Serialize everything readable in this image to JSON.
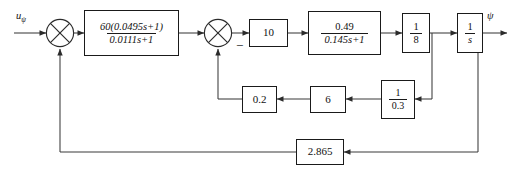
{
  "diagram": {
    "input_label": "u",
    "input_subscript": "ψ",
    "output_label": "ψ",
    "minus_sign": "−",
    "line_color": "#3a3a3a",
    "block_border_color": "#1a1a1a",
    "background": "#ffffff"
  },
  "blocks": [
    {
      "id": "controller",
      "name": "lead-lag-controller",
      "kind": "transfer-function",
      "numerator": "60(0.0495s+1)",
      "denominator": "0.0111s+1"
    },
    {
      "id": "gain10",
      "name": "gain-10",
      "kind": "gain",
      "value": "10"
    },
    {
      "id": "actuator",
      "name": "actuator-transfer-function",
      "kind": "transfer-function",
      "numerator": "0.49",
      "denominator": "0.145s+1"
    },
    {
      "id": "gain18",
      "name": "gain-one-eighth",
      "kind": "transfer-function",
      "numerator": "1",
      "denominator": "8"
    },
    {
      "id": "integrator",
      "name": "integrator",
      "kind": "transfer-function",
      "numerator": "1",
      "denominator": "s"
    },
    {
      "id": "fb02",
      "name": "feedback-gain-0-2",
      "kind": "gain",
      "value": "0.2"
    },
    {
      "id": "fb6",
      "name": "feedback-gain-6",
      "kind": "gain",
      "value": "6"
    },
    {
      "id": "fb03",
      "name": "feedback-gain-one-over-0-3",
      "kind": "transfer-function",
      "numerator": "1",
      "denominator": "0.3"
    },
    {
      "id": "outer",
      "name": "outer-feedback-gain-2-865",
      "kind": "gain",
      "value": "2.865"
    }
  ],
  "summing_junctions": [
    {
      "id": "sum1",
      "name": "summing-junction-input",
      "signs": [
        "+",
        "+"
      ]
    },
    {
      "id": "sum2",
      "name": "summing-junction-inner",
      "signs": [
        "+",
        "−"
      ]
    }
  ]
}
